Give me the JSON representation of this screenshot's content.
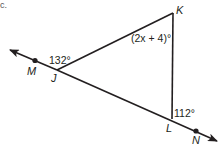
{
  "header": {
    "fragment": "c."
  },
  "diagram": {
    "type": "triangle-with-exterior-angles",
    "points": {
      "M": {
        "label": "M"
      },
      "J": {
        "label": "J"
      },
      "K": {
        "label": "K"
      },
      "L": {
        "label": "L"
      },
      "N": {
        "label": "N"
      }
    },
    "angles": {
      "exterior_J": "132°",
      "interior_K": "(2x + 4)°",
      "exterior_L": "112°"
    },
    "colors": {
      "stroke": "#231f20",
      "background": "#ffffff"
    }
  }
}
